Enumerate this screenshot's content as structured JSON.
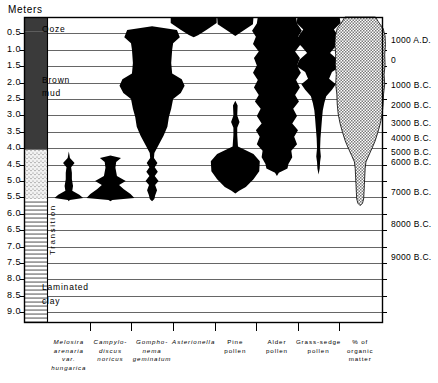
{
  "chart_data": {
    "type": "area",
    "title": "Meters",
    "ylabel": "Meters",
    "subtype": "stratigraphic-pollen-diatom-diagram",
    "grid": true,
    "legend_position": "none",
    "depth_axis": {
      "label": "Meters",
      "unit": "m",
      "range": [
        0.0,
        9.0
      ],
      "ticks": [
        "0.5",
        "1.0",
        "1.5",
        "2.0",
        "2.5",
        "3.0",
        "3.5",
        "4.0",
        "4.5",
        "5.0",
        "5.5",
        "6.0",
        "6.5",
        "7.0",
        "7.5",
        "8.0",
        "8.5",
        "9.0"
      ],
      "tick_values": [
        0.5,
        1.0,
        1.5,
        2.0,
        2.5,
        3.0,
        3.5,
        4.0,
        4.5,
        5.0,
        5.5,
        6.0,
        6.5,
        7.0,
        7.5,
        8.0,
        8.5,
        9.0
      ]
    },
    "date_axis": {
      "ticks": [
        "1000 A.D.",
        "0",
        "1000 B.C.",
        "2000 B.C.",
        "3000 B.C.",
        "4000 B.C.",
        "5000 B.C.",
        "6000 B.C.",
        "7000 B.C.",
        "8000 B.C.",
        "9000 B.C."
      ],
      "depths": [
        0.72,
        1.35,
        2.1,
        2.72,
        3.25,
        3.72,
        4.15,
        4.45,
        5.38,
        6.35,
        7.35
      ]
    },
    "lithology": {
      "units": [
        {
          "name": "Ooze",
          "fill": "dark",
          "from": 0.0,
          "to": 0.45
        },
        {
          "name": "Brown mud",
          "fill": "dark",
          "from": 0.45,
          "to": 4.05
        },
        {
          "name": "Transition",
          "fill": "stipple",
          "from": 4.05,
          "to": 5.55
        },
        {
          "name": "Laminated clay",
          "fill": "lines",
          "from": 5.55,
          "to": 9.3
        }
      ]
    },
    "columns": [
      {
        "name": "Melosira arenaria var. hungarica",
        "label": "Melosira\narenaria\nvar.\nhungarica",
        "italic": true
      },
      {
        "name": "Campylodiscus noricus",
        "label": "Campylo-\ndiscus\nnoricus",
        "italic": true
      },
      {
        "name": "Gomphonema geminatum",
        "label": "Gompho-\nnema\ngeminatum",
        "italic": true
      },
      {
        "name": "Asterionella",
        "label": "Asterionella",
        "italic": true
      },
      {
        "name": "Pine pollen",
        "label": "Pine\npollen",
        "italic": false
      },
      {
        "name": "Alder pollen",
        "label": "Alder\npollen",
        "italic": false
      },
      {
        "name": "Grass-sedge pollen",
        "label": "Grass-sedge\npollen",
        "italic": false
      },
      {
        "name": "% of organic matter",
        "label": "% of\norganic\nmatter",
        "italic": false
      }
    ],
    "series": [
      {
        "name": "Melosira arenaria var. hungarica",
        "fill": "#000000",
        "profile": [
          [
            4.1,
            0
          ],
          [
            4.3,
            0.06
          ],
          [
            4.45,
            0.3
          ],
          [
            4.58,
            0.12
          ],
          [
            4.75,
            0.16
          ],
          [
            4.95,
            0.16
          ],
          [
            5.15,
            0.22
          ],
          [
            5.3,
            0.18
          ],
          [
            5.42,
            0.55
          ],
          [
            5.52,
            0.75
          ],
          [
            5.58,
            0.05
          ],
          [
            5.62,
            0
          ]
        ]
      },
      {
        "name": "Campylodiscus noricus",
        "fill": "#000000",
        "profile": [
          [
            4.22,
            0
          ],
          [
            4.3,
            0.55
          ],
          [
            4.42,
            0.3
          ],
          [
            4.6,
            0.26
          ],
          [
            4.85,
            0.34
          ],
          [
            5.0,
            0.8
          ],
          [
            5.12,
            0.45
          ],
          [
            5.25,
            0.7
          ],
          [
            5.4,
            1.05
          ],
          [
            5.52,
            1.25
          ],
          [
            5.58,
            0.1
          ],
          [
            5.62,
            0
          ]
        ]
      },
      {
        "name": "Gomphonema geminatum",
        "fill": "#000000",
        "profile": [
          [
            0.28,
            0
          ],
          [
            0.4,
            1.3
          ],
          [
            0.62,
            1.45
          ],
          [
            0.8,
            1.1
          ],
          [
            1.0,
            1.05
          ],
          [
            1.4,
            1.0
          ],
          [
            1.72,
            1.05
          ],
          [
            1.9,
            1.55
          ],
          [
            2.1,
            1.7
          ],
          [
            2.32,
            1.5
          ],
          [
            2.5,
            1.1
          ],
          [
            2.8,
            1.0
          ],
          [
            3.05,
            0.88
          ],
          [
            3.35,
            0.8
          ],
          [
            3.62,
            0.6
          ],
          [
            3.95,
            0.3
          ],
          [
            4.15,
            0.12
          ],
          [
            4.3,
            0.1
          ],
          [
            4.45,
            0.28
          ],
          [
            4.58,
            0.14
          ],
          [
            4.72,
            0.3
          ],
          [
            4.85,
            0.14
          ],
          [
            5.0,
            0.34
          ],
          [
            5.12,
            0.16
          ],
          [
            5.28,
            0.26
          ],
          [
            5.44,
            0.16
          ],
          [
            5.55,
            0.12
          ],
          [
            5.62,
            0
          ]
        ]
      },
      {
        "name": "Asterionella",
        "fill": "#000000",
        "profile": [
          [
            0.0,
            1.2
          ],
          [
            0.18,
            1.2
          ],
          [
            0.38,
            0.7
          ],
          [
            0.55,
            0.25
          ],
          [
            0.62,
            0
          ]
        ]
      },
      {
        "name": "Pine pollen",
        "fill": "#000000",
        "profile": [
          [
            0.0,
            0.95
          ],
          [
            0.22,
            0.92
          ],
          [
            0.44,
            0.35
          ],
          [
            0.58,
            0
          ],
          [
            2.55,
            0
          ],
          [
            2.7,
            0.12
          ],
          [
            3.0,
            0.1
          ],
          [
            3.2,
            0.22
          ],
          [
            3.38,
            0.1
          ],
          [
            3.6,
            0.1
          ],
          [
            3.95,
            0.14
          ],
          [
            4.18,
            0.95
          ],
          [
            4.4,
            1.28
          ],
          [
            4.7,
            1.25
          ],
          [
            4.95,
            0.95
          ],
          [
            5.18,
            0.55
          ],
          [
            5.3,
            0.2
          ],
          [
            5.38,
            0
          ]
        ]
      },
      {
        "name": "Alder pollen",
        "fill": "#000000",
        "profile": [
          [
            0.0,
            1.0
          ],
          [
            0.2,
            1.05
          ],
          [
            0.42,
            1.3
          ],
          [
            0.6,
            1.1
          ],
          [
            0.82,
            1.25
          ],
          [
            1.05,
            0.95
          ],
          [
            1.25,
            1.2
          ],
          [
            1.48,
            1.05
          ],
          [
            1.7,
            1.25
          ],
          [
            1.92,
            1.0
          ],
          [
            2.15,
            1.2
          ],
          [
            2.38,
            0.95
          ],
          [
            2.58,
            1.15
          ],
          [
            2.8,
            0.85
          ],
          [
            3.02,
            1.05
          ],
          [
            3.25,
            0.8
          ],
          [
            3.45,
            1.1
          ],
          [
            3.65,
            0.9
          ],
          [
            3.88,
            1.05
          ],
          [
            4.08,
            0.75
          ],
          [
            4.28,
            0.8
          ],
          [
            4.48,
            0.6
          ],
          [
            4.62,
            0.55
          ],
          [
            4.75,
            0.1
          ],
          [
            4.85,
            0
          ]
        ]
      },
      {
        "name": "Grass-sedge pollen",
        "fill": "#000000",
        "profile": [
          [
            0.0,
            1.1
          ],
          [
            0.18,
            1.15
          ],
          [
            0.38,
            0.8
          ],
          [
            0.55,
            1.0
          ],
          [
            0.72,
            1.2
          ],
          [
            0.92,
            0.85
          ],
          [
            1.1,
            0.6
          ],
          [
            1.3,
            1.0
          ],
          [
            1.5,
            1.15
          ],
          [
            1.68,
            0.7
          ],
          [
            1.88,
            0.55
          ],
          [
            2.05,
            0.9
          ],
          [
            2.22,
            0.7
          ],
          [
            2.42,
            0.4
          ],
          [
            2.62,
            0.3
          ],
          [
            2.85,
            0.22
          ],
          [
            3.1,
            0.18
          ],
          [
            3.4,
            0.14
          ],
          [
            3.7,
            0.1
          ],
          [
            4.0,
            0.08
          ],
          [
            4.25,
            0.12
          ],
          [
            4.42,
            0.08
          ],
          [
            4.62,
            0.06
          ],
          [
            4.8,
            0
          ]
        ]
      },
      {
        "name": "% of organic matter",
        "fill": "#b8b8b8",
        "hatch": true,
        "profile": [
          [
            0.0,
            0.8
          ],
          [
            0.15,
            0.95
          ],
          [
            0.35,
            1.2
          ],
          [
            0.58,
            1.3
          ],
          [
            0.85,
            1.32
          ],
          [
            1.15,
            1.28
          ],
          [
            1.45,
            1.3
          ],
          [
            1.75,
            1.25
          ],
          [
            2.05,
            1.28
          ],
          [
            2.35,
            1.22
          ],
          [
            2.65,
            1.2
          ],
          [
            2.95,
            1.15
          ],
          [
            3.25,
            1.05
          ],
          [
            3.52,
            0.92
          ],
          [
            3.78,
            0.78
          ],
          [
            4.0,
            0.62
          ],
          [
            4.22,
            0.45
          ],
          [
            4.42,
            0.3
          ],
          [
            4.62,
            0.26
          ],
          [
            4.85,
            0.24
          ],
          [
            5.1,
            0.22
          ],
          [
            5.35,
            0.2
          ],
          [
            5.55,
            0.18
          ],
          [
            5.68,
            0.12
          ],
          [
            5.75,
            0
          ]
        ]
      }
    ]
  },
  "axis": {
    "title": "Meters",
    "depth_ticks": [
      "0.5",
      "1.0",
      "1.5",
      "2.0",
      "2.5",
      "3.0",
      "3.5",
      "4.0",
      "4.5",
      "5.0",
      "5.5",
      "6.0",
      "6.5",
      "7.0",
      "7.5",
      "8.0",
      "8.5",
      "9.0"
    ],
    "date_ticks": [
      "1000 A.D.",
      "0",
      "1000 B.C.",
      "2000 B.C.",
      "3000 B.C.",
      "4000 B.C.",
      "5000 B.C.",
      "6000 B.C.",
      "7000 B.C.",
      "8000 B.C.",
      "9000 B.C."
    ]
  },
  "lithology_labels": {
    "ooze": "Ooze",
    "brown": "Brown",
    "mud": "mud",
    "transition": "Transition",
    "laminated": "Laminated",
    "clay": "clay"
  },
  "column_labels": {
    "c0_l0": "Melosira",
    "c0_l1": "arenaria",
    "c0_l2": "var.",
    "c0_l3": "hungarica",
    "c1_l0": "Campylo-",
    "c1_l1": "discus",
    "c1_l2": "noricus",
    "c2_l0": "Gompho-",
    "c2_l1": "nema",
    "c2_l2": "geminatum",
    "c3_l0": "Asterionella",
    "c4_l0": "Pine",
    "c4_l1": "pollen",
    "c5_l0": "Alder",
    "c5_l1": "pollen",
    "c6_l0": "Grass-sedge",
    "c6_l1": "pollen",
    "c7_l0": "% of",
    "c7_l1": "organic",
    "c7_l2": "matter"
  },
  "colors": {
    "ink": "#000000",
    "grid": "#555555",
    "frame": "#000000",
    "organic_fill": "#b9b9b9",
    "lith_dark": "#3a3a3a"
  }
}
